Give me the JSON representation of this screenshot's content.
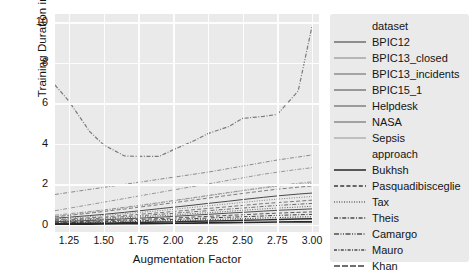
{
  "chart_data": {
    "type": "line",
    "title": "",
    "xlabel": "Augmentation Factor",
    "ylabel": "Training Duration in hours",
    "xlim": [
      1.15,
      3.05
    ],
    "ylim": [
      -0.35,
      10.4
    ],
    "xticks": [
      "1.25",
      "1.50",
      "1.75",
      "2.00",
      "2.25",
      "2.50",
      "2.75",
      "3.00"
    ],
    "xtick_values": [
      1.25,
      1.5,
      1.75,
      2.0,
      2.25,
      2.5,
      2.75,
      3.0
    ],
    "yticks": [
      "0",
      "2",
      "4",
      "6",
      "8",
      "10"
    ],
    "ytick_values": [
      0,
      2,
      4,
      6,
      8,
      10
    ],
    "grid": true,
    "grid_color": "#fdfdfd",
    "panel_color": "#eaeaea",
    "legend_position": "right",
    "x": [
      1.15,
      1.25,
      1.4,
      1.5,
      1.65,
      1.75,
      1.9,
      2.0,
      2.15,
      2.25,
      2.4,
      2.5,
      2.65,
      2.75,
      2.9,
      3.0
    ],
    "series": [
      {
        "name": "NASA-Khan",
        "dataset": "NASA",
        "approach": "Khan",
        "style": "dashdot",
        "color": "#7a7a7a",
        "width": 1.2,
        "values": [
          6.9,
          6.1,
          4.6,
          3.95,
          3.4,
          3.38,
          3.38,
          3.7,
          4.15,
          4.5,
          4.85,
          5.25,
          5.35,
          5.45,
          6.6,
          9.8
        ]
      },
      {
        "name": "BPIC15_1-Camargo",
        "dataset": "BPIC15_1",
        "approach": "Camargo",
        "style": "dashdot",
        "color": "#8a8a8a",
        "width": 1.0,
        "values": [
          1.5,
          1.6,
          1.75,
          1.85,
          2.0,
          2.1,
          2.25,
          2.35,
          2.5,
          2.6,
          2.78,
          2.9,
          3.08,
          3.2,
          3.35,
          3.45
        ]
      },
      {
        "name": "BPIC13_incidents-Mauro",
        "dataset": "BPIC13_incidents",
        "approach": "Mauro",
        "style": "dashdot",
        "color": "#969696",
        "width": 1.0,
        "values": [
          0.7,
          0.82,
          1.0,
          1.12,
          1.3,
          1.42,
          1.6,
          1.72,
          1.9,
          2.02,
          2.2,
          2.32,
          2.5,
          2.6,
          2.74,
          2.82
        ]
      },
      {
        "name": "Helpdesk-Theis",
        "dataset": "Helpdesk",
        "approach": "Theis",
        "style": "dashdot",
        "color": "#8f8f8f",
        "width": 0.9,
        "values": [
          0.48,
          0.55,
          0.66,
          0.74,
          0.87,
          0.96,
          1.1,
          1.2,
          1.35,
          1.45,
          1.6,
          1.7,
          1.84,
          1.93,
          2.05,
          2.12
        ]
      },
      {
        "name": "Sepsis-Tax",
        "dataset": "Sepsis",
        "approach": "Tax",
        "style": "dotted",
        "color": "#8c8c8c",
        "width": 0.9,
        "values": [
          0.42,
          0.5,
          0.62,
          0.7,
          0.84,
          0.93,
          1.08,
          1.18,
          1.33,
          1.43,
          1.58,
          1.68,
          1.82,
          1.9,
          2.0,
          2.05
        ]
      },
      {
        "name": "BPIC12-Pasquadibisceglie",
        "dataset": "BPIC12",
        "approach": "Pasquadibisceglie",
        "style": "dashed",
        "color": "#6f6f6f",
        "width": 0.9,
        "values": [
          0.4,
          0.47,
          0.58,
          0.66,
          0.78,
          0.87,
          1.0,
          1.09,
          1.23,
          1.32,
          1.46,
          1.55,
          1.68,
          1.76,
          1.86,
          1.92
        ]
      },
      {
        "name": "BPIC13_closed-Bukhsh",
        "dataset": "BPIC13_closed",
        "approach": "Bukhsh",
        "style": "solid",
        "color": "#4a4a4a",
        "width": 1.0,
        "values": [
          0.33,
          0.38,
          0.46,
          0.52,
          0.62,
          0.69,
          0.8,
          0.87,
          0.98,
          1.06,
          1.17,
          1.25,
          1.36,
          1.43,
          1.52,
          1.57
        ]
      },
      {
        "name": "band-a",
        "dataset": "",
        "approach": "",
        "style": "dotted",
        "color": "#787878",
        "width": 0.9,
        "values": [
          0.3,
          0.34,
          0.41,
          0.46,
          0.55,
          0.61,
          0.7,
          0.77,
          0.87,
          0.94,
          1.04,
          1.11,
          1.21,
          1.27,
          1.35,
          1.4
        ]
      },
      {
        "name": "band-b",
        "dataset": "",
        "approach": "",
        "style": "dashed",
        "color": "#6b6b6b",
        "width": 0.9,
        "values": [
          0.26,
          0.29,
          0.35,
          0.39,
          0.47,
          0.52,
          0.6,
          0.66,
          0.75,
          0.81,
          0.9,
          0.96,
          1.05,
          1.1,
          1.17,
          1.22
        ]
      },
      {
        "name": "band-c",
        "dataset": "",
        "approach": "",
        "style": "dashdot",
        "color": "#5e5e5e",
        "width": 0.9,
        "values": [
          0.22,
          0.25,
          0.3,
          0.34,
          0.41,
          0.45,
          0.52,
          0.57,
          0.65,
          0.7,
          0.78,
          0.83,
          0.91,
          0.96,
          1.02,
          1.06
        ]
      },
      {
        "name": "band-d",
        "dataset": "",
        "approach": "",
        "style": "dotted",
        "color": "#555555",
        "width": 0.9,
        "values": [
          0.19,
          0.21,
          0.26,
          0.29,
          0.35,
          0.39,
          0.45,
          0.49,
          0.56,
          0.6,
          0.67,
          0.72,
          0.79,
          0.83,
          0.88,
          0.92
        ]
      },
      {
        "name": "band-e",
        "dataset": "",
        "approach": "",
        "style": "solid",
        "color": "#4f4f4f",
        "width": 1.0,
        "values": [
          0.16,
          0.18,
          0.22,
          0.25,
          0.3,
          0.33,
          0.38,
          0.42,
          0.48,
          0.52,
          0.58,
          0.62,
          0.68,
          0.72,
          0.76,
          0.79
        ]
      },
      {
        "name": "band-f",
        "dataset": "",
        "approach": "",
        "style": "dashed",
        "color": "#474747",
        "width": 0.9,
        "values": [
          0.13,
          0.15,
          0.18,
          0.2,
          0.24,
          0.27,
          0.31,
          0.34,
          0.39,
          0.42,
          0.47,
          0.5,
          0.55,
          0.58,
          0.62,
          0.64
        ]
      },
      {
        "name": "band-g",
        "dataset": "",
        "approach": "",
        "style": "dashdot",
        "color": "#3f3f3f",
        "width": 1.0,
        "values": [
          0.1,
          0.11,
          0.14,
          0.16,
          0.19,
          0.21,
          0.25,
          0.27,
          0.31,
          0.34,
          0.38,
          0.4,
          0.44,
          0.47,
          0.5,
          0.52
        ]
      },
      {
        "name": "band-h",
        "dataset": "",
        "approach": "",
        "style": "dotted",
        "color": "#383838",
        "width": 1.0,
        "values": [
          0.08,
          0.09,
          0.11,
          0.12,
          0.15,
          0.17,
          0.19,
          0.21,
          0.24,
          0.26,
          0.29,
          0.31,
          0.34,
          0.36,
          0.39,
          0.4
        ]
      },
      {
        "name": "band-i",
        "dataset": "",
        "approach": "",
        "style": "solid",
        "color": "#2e2e2e",
        "width": 1.4,
        "values": [
          0.06,
          0.07,
          0.08,
          0.09,
          0.11,
          0.12,
          0.14,
          0.15,
          0.18,
          0.19,
          0.21,
          0.23,
          0.25,
          0.27,
          0.29,
          0.3
        ]
      },
      {
        "name": "band-j",
        "dataset": "",
        "approach": "",
        "style": "solid",
        "color": "#262626",
        "width": 1.6,
        "values": [
          0.03,
          0.03,
          0.04,
          0.05,
          0.06,
          0.06,
          0.07,
          0.08,
          0.09,
          0.1,
          0.11,
          0.12,
          0.13,
          0.14,
          0.15,
          0.15
        ]
      }
    ]
  },
  "legend": {
    "groups": [
      {
        "title": "dataset",
        "entries": [
          {
            "label": "BPIC12",
            "style": "solid",
            "color": "#6e6e6e"
          },
          {
            "label": "BPIC13_closed",
            "style": "solid",
            "color": "#a5a5a5"
          },
          {
            "label": "BPIC13_incidents",
            "style": "solid",
            "color": "#8d8d8d"
          },
          {
            "label": "BPIC15_1",
            "style": "solid",
            "color": "#7c7c7c"
          },
          {
            "label": "Helpdesk",
            "style": "solid",
            "color": "#808080"
          },
          {
            "label": "NASA",
            "style": "solid",
            "color": "#8a8a8a"
          },
          {
            "label": "Sepsis",
            "style": "solid",
            "color": "#b0b0b0"
          }
        ]
      },
      {
        "title": "approach",
        "entries": [
          {
            "label": "Pasquadibisceglie",
            "style": "dashed",
            "color": "#3a3a3a"
          },
          {
            "label": "Tax",
            "style": "dotted",
            "color": "#6a6a6a"
          },
          {
            "label": "Theis",
            "style": "dashdot",
            "color": "#4a4a4a"
          },
          {
            "label": "Camargo",
            "style": "dashdotdot",
            "color": "#4f4f4f"
          },
          {
            "label": "Mauro",
            "style": "dashdot2",
            "color": "#4a4a4a"
          },
          {
            "label": "Khan",
            "style": "longdash",
            "color": "#3f3f3f"
          }
        ],
        "first_entry": {
          "label": "Bukhsh",
          "style": "solid",
          "color": "#262626"
        }
      }
    ]
  }
}
